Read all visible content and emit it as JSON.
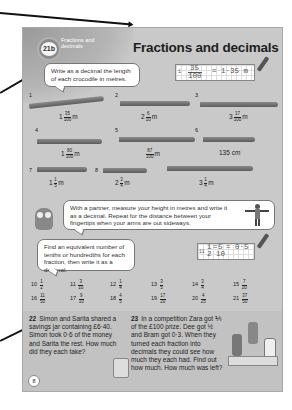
{
  "header": {
    "unit_badge": "21b",
    "unit_label": "Fractions and decimals",
    "title": "Fractions and decimals"
  },
  "section1": {
    "instruction": "Write as a decimal the length of each crocodile in metres.",
    "example": {
      "number": "1",
      "fraction_num": "35",
      "fraction_den": "100",
      "answer": "= 1·35 m"
    },
    "crocodiles": [
      {
        "number": "1",
        "whole": "1",
        "num": "35",
        "den": "100",
        "unit": "m"
      },
      {
        "number": "2",
        "whole": "2",
        "num": "6",
        "den": "10",
        "unit": "m"
      },
      {
        "number": "3",
        "whole": "3",
        "num": "17",
        "den": "100",
        "unit": "m"
      },
      {
        "number": "4",
        "whole": "1",
        "num": "80",
        "den": "100",
        "unit": "m"
      },
      {
        "number": "5",
        "whole": "",
        "num": "87",
        "den": "100",
        "unit": "m"
      },
      {
        "number": "6",
        "value": "135 cm"
      },
      {
        "number": "7",
        "whole": "1",
        "num": "1",
        "den": "5",
        "unit": "m"
      },
      {
        "number": "8",
        "whole": "2",
        "num": "3",
        "den": "4",
        "unit": "m"
      },
      {
        "number": "9",
        "whole": "3",
        "num": "1",
        "den": "4",
        "unit": "m"
      }
    ]
  },
  "section2": {
    "instruction": "With a partner, measure your height in metres and write it as a decimal. Repeat for the distance between your fingertips when your arms are out sideways."
  },
  "section3": {
    "instruction": "Find an equivalent number of tenths or hundredths for each fraction, then write it as a decimal.",
    "example": {
      "number": "11",
      "num": "1",
      "den": "2",
      "eq_num": "5",
      "eq_den": "10",
      "answer": "= 0·5"
    },
    "questions": [
      {
        "number": "10",
        "num": "1",
        "den": "2"
      },
      {
        "number": "11",
        "num": "3",
        "den": "10"
      },
      {
        "number": "12",
        "num": "1",
        "den": "4"
      },
      {
        "number": "13",
        "num": "3",
        "den": "5"
      },
      {
        "number": "14",
        "num": "3",
        "den": "4"
      },
      {
        "number": "15",
        "num": "7",
        "den": "20"
      },
      {
        "number": "16",
        "num": "11",
        "den": "50"
      },
      {
        "number": "17",
        "num": "9",
        "den": "10"
      },
      {
        "number": "18",
        "num": "4",
        "den": "5"
      },
      {
        "number": "19",
        "num": "17",
        "den": "20"
      },
      {
        "number": "20",
        "num": "4",
        "den": "25"
      },
      {
        "number": "21",
        "num": "37",
        "den": "50"
      }
    ]
  },
  "word_problems": [
    {
      "number": "22",
      "text": "Simon and Sarita shared a savings jar containing £6·40. Simon took 0·6 of the money and Sarita the rest. How much did they each take?"
    },
    {
      "number": "23",
      "text": "In a competition Zara got ⅕ of the £100 prize. Dee got ½ and Bram got 0·3. When they turned each fraction into decimals they could see how much they each had. Find out how much. How much was left?"
    }
  ],
  "page_number": "8"
}
